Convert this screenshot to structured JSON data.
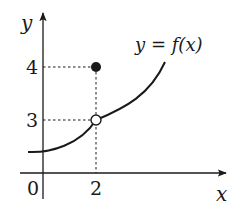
{
  "diagram": {
    "type": "function-graph",
    "axes": {
      "x_label": "x",
      "y_label": "y",
      "origin_label": "0"
    },
    "ticks": {
      "x": [
        "2"
      ],
      "y": [
        "4",
        "3"
      ]
    },
    "curve_label": "y = f(x)",
    "points": [
      {
        "name": "filled-point",
        "x": 2,
        "y": 4,
        "style": "filled"
      },
      {
        "name": "open-point",
        "x": 2,
        "y": 3,
        "style": "open"
      }
    ],
    "colors": {
      "stroke": "#1a1a1a",
      "background": "#ffffff"
    }
  }
}
